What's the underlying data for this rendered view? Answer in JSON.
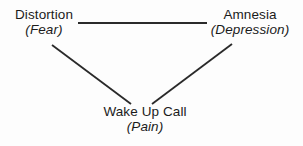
{
  "diagram": {
    "background_color": "#fdfdfd",
    "line_color": "#2a2a2a",
    "text_color": "#1b1b1b",
    "nodes": [
      {
        "id": "distortion",
        "primary": "Distortion",
        "secondary": "(Fear)"
      },
      {
        "id": "amnesia",
        "primary": "Amnesia",
        "secondary": "(Depression)"
      },
      {
        "id": "wake-up-call",
        "primary": "Wake Up Call",
        "secondary": "(Pain)"
      }
    ],
    "edges": [
      {
        "id": "distortion-amnesia",
        "from": "distortion",
        "to": "amnesia",
        "x1": 78,
        "y1": 23,
        "x2": 207,
        "y2": 23
      },
      {
        "id": "distortion-wake-up-call",
        "from": "distortion",
        "to": "wake-up-call",
        "x1": 52,
        "y1": 45,
        "x2": 131,
        "y2": 104
      },
      {
        "id": "amnesia-wake-up-call",
        "from": "amnesia",
        "to": "wake-up-call",
        "x1": 232,
        "y1": 44,
        "x2": 152,
        "y2": 104
      }
    ]
  }
}
